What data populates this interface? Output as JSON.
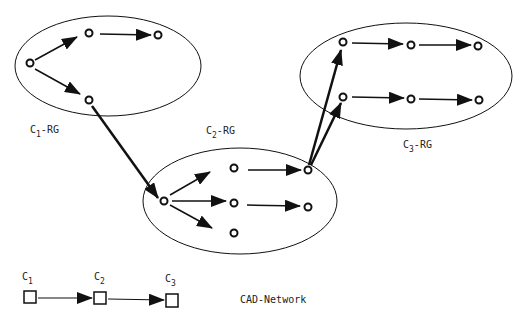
{
  "diagram": {
    "groups": [
      {
        "id": "c1",
        "label": "C",
        "subscript": "1",
        "suffix": "-RG"
      },
      {
        "id": "c2",
        "label": "C",
        "subscript": "2",
        "suffix": "-RG"
      },
      {
        "id": "c3",
        "label": "C",
        "subscript": "3",
        "suffix": "-RG"
      }
    ],
    "network": {
      "title": "CAD-Network",
      "nodes": [
        {
          "label": "C",
          "subscript": "1"
        },
        {
          "label": "C",
          "subscript": "2"
        },
        {
          "label": "C",
          "subscript": "3"
        }
      ]
    },
    "colors": {
      "stroke": "#111111",
      "background": "#ffffff"
    }
  }
}
